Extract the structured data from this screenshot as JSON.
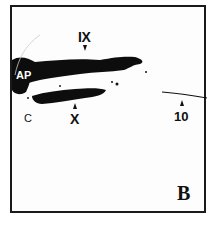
{
  "figure": {
    "panel_label": "B",
    "labels": {
      "ix": "IX",
      "x": "X",
      "ap": "AP",
      "c": "C",
      "ten": "10"
    },
    "colors": {
      "background": "#ffffff",
      "stain": "#0d0d0d",
      "border": "#1a1a1a"
    }
  }
}
